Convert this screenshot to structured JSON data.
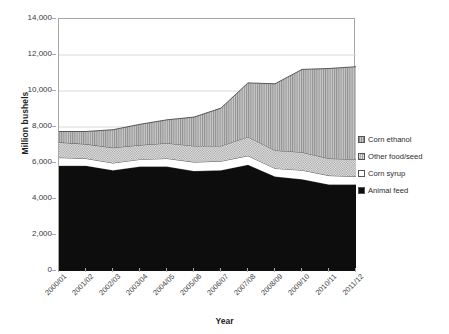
{
  "chart_data": {
    "type": "area",
    "stacked": true,
    "title": "",
    "xlabel": "Year",
    "ylabel": "Million bushels",
    "ylim": [
      0,
      14000
    ],
    "ytick_step": 2000,
    "ytick_labels": [
      "14,000",
      "12,000",
      "10,000",
      "8,000",
      "6,000",
      "4,000",
      "2,000",
      "0"
    ],
    "ytick_values": [
      14000,
      12000,
      10000,
      8000,
      6000,
      4000,
      2000,
      0
    ],
    "grid": "horizontal",
    "legend_position": "right",
    "legend_order": [
      "Corn ethanol",
      "Other food/seed",
      "Corn syrup",
      "Animal feed"
    ],
    "categories": [
      "2000/01",
      "2001/02",
      "2002/03",
      "2003/04",
      "2004/05",
      "2005/06",
      "2006/07",
      "2007/08",
      "2008/09",
      "2009/10",
      "2010/11",
      "2011/12"
    ],
    "series": [
      {
        "name": "Animal feed",
        "stack_order": 1,
        "fill": "#0d0d0d",
        "pattern": "solid",
        "values": [
          5850,
          5850,
          5600,
          5800,
          5800,
          5550,
          5600,
          5900,
          5250,
          5100,
          4800,
          4800
        ]
      },
      {
        "name": "Corn syrup",
        "stack_order": 2,
        "fill": "#ffffff",
        "pattern": "none",
        "values": [
          450,
          400,
          400,
          400,
          450,
          500,
          500,
          500,
          450,
          500,
          500,
          450
        ]
      },
      {
        "name": "Other food/seed",
        "stack_order": 3,
        "fill": "#d8d8d8",
        "pattern": "checker",
        "values": [
          850,
          800,
          850,
          800,
          850,
          900,
          850,
          1050,
          1000,
          1000,
          950,
          950
        ]
      },
      {
        "name": "Corn ethanol",
        "stack_order": 4,
        "fill": "#b0b0b0",
        "pattern": "vertical-hatch",
        "values": [
          600,
          700,
          1000,
          1150,
          1300,
          1600,
          2100,
          3000,
          3700,
          4600,
          5000,
          5150
        ]
      }
    ],
    "stacked_totals": [
      7750,
      7750,
      7850,
      8150,
      8400,
      8550,
      9050,
      10450,
      10400,
      11200,
      11250,
      11350
    ],
    "colors": {
      "animal_feed": "#0d0d0d",
      "corn_syrup": "#ffffff",
      "other_food_seed": "#d8d8d8",
      "corn_ethanol": "#b0b0b0",
      "axis": "#a6a6a6",
      "gridline": "#d9d9d9",
      "outline": "#4a4a4a",
      "text": "#2b2b2b",
      "background": "#ffffff"
    }
  }
}
